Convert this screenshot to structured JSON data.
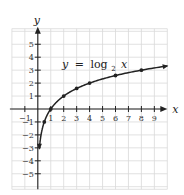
{
  "chart_data": {
    "type": "line",
    "title": "",
    "function_label": {
      "lhs": "y",
      "eq": "=",
      "fn": "log",
      "sub": "2",
      "arg": "x"
    },
    "xlabel": "x",
    "ylabel": "y",
    "xlim": [
      -2,
      10
    ],
    "ylim": [
      -6.2,
      6.2
    ],
    "grid": true,
    "x_ticks": [
      -1,
      1,
      2,
      3,
      4,
      5,
      6,
      7,
      8,
      9
    ],
    "y_ticks": [
      -5,
      -4,
      -3,
      -2,
      -1,
      1,
      2,
      3,
      4,
      5
    ],
    "series": [
      {
        "name": "y = log2 x",
        "points": [
          {
            "x": 0.125,
            "y": -3
          },
          {
            "x": 0.5,
            "y": -1
          },
          {
            "x": 1,
            "y": 0
          },
          {
            "x": 2,
            "y": 1
          },
          {
            "x": 3,
            "y": 1.585
          },
          {
            "x": 4,
            "y": 2
          },
          {
            "x": 6,
            "y": 2.585
          },
          {
            "x": 8,
            "y": 3
          },
          {
            "x": 10,
            "y": 3.32
          }
        ],
        "marked_points": [
          {
            "x": 0.5,
            "y": -1
          },
          {
            "x": 1,
            "y": 0
          },
          {
            "x": 2,
            "y": 1
          },
          {
            "x": 3,
            "y": 1.585
          },
          {
            "x": 4,
            "y": 2
          },
          {
            "x": 6,
            "y": 2.585
          },
          {
            "x": 8,
            "y": 3
          }
        ]
      }
    ]
  }
}
